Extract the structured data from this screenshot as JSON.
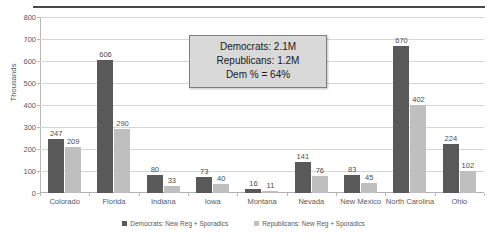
{
  "chart_data": {
    "type": "bar",
    "title": "",
    "xlabel": "",
    "ylabel": "Thousands",
    "ylim": [
      0,
      800
    ],
    "ytick_step": 100,
    "yticks": [
      "0",
      "100",
      "200",
      "300",
      "400",
      "500",
      "600",
      "700",
      "800"
    ],
    "grid": true,
    "legend_position": "bottom",
    "categories": [
      "Colorado",
      "Florida",
      "Indiana",
      "Iowa",
      "Montana",
      "Nevada",
      "New Mexico",
      "North Carolina",
      "Ohio"
    ],
    "series": [
      {
        "name": "Democrats:  New Reg + Sporadics",
        "color": "#595959",
        "values": [
          247,
          606,
          80,
          73,
          16,
          141,
          83,
          670,
          224
        ]
      },
      {
        "name": "Republicans:  New Reg + Sporadics",
        "color": "#bfbfbf",
        "values": [
          209,
          290,
          33,
          40,
          11,
          76,
          45,
          402,
          102
        ]
      }
    ],
    "annotations": [
      {
        "name": "summary-callout",
        "lines": [
          "Democrats:  2.1M",
          "Republicans: 1.2M",
          "Dem % = 64%"
        ]
      }
    ]
  }
}
